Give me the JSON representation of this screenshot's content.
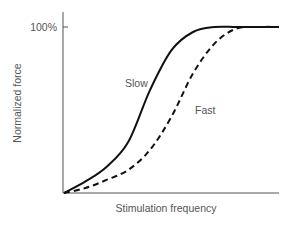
{
  "chart_data": {
    "type": "line",
    "title": "",
    "xlabel": "Stimulation frequency",
    "ylabel": "Normalized force",
    "y_ticks": [
      "100%"
    ],
    "x_ticks": [],
    "grid": false,
    "legend": "inline labels",
    "ylim": [
      0,
      100
    ],
    "x": [
      0,
      10,
      20,
      30,
      40,
      50,
      60,
      70,
      80,
      90,
      100
    ],
    "series": [
      {
        "name": "Slow",
        "style": "solid",
        "color": "#111111",
        "values": [
          0,
          7,
          16,
          31,
          62,
          86,
          97,
          100,
          100,
          100,
          100
        ]
      },
      {
        "name": "Fast",
        "style": "dashed",
        "color": "#111111",
        "values": [
          0,
          3,
          8,
          14,
          26,
          46,
          72,
          90,
          99,
          100,
          100
        ]
      }
    ],
    "annotations": [
      "Slow",
      "Fast"
    ]
  },
  "labels": {
    "ylabel": "Normalized force",
    "xlabel": "Stimulation frequency",
    "ytick": "100%",
    "slow": "Slow",
    "fast": "Fast"
  }
}
